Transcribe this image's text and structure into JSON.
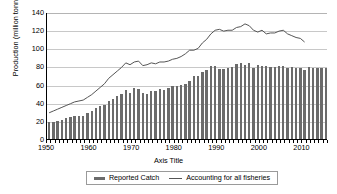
{
  "chart_data": {
    "type": "bar",
    "title": "",
    "xlabel": "Axis Title",
    "ylabel": "Production (million tonnes)",
    "ylim": [
      0,
      140
    ],
    "ytick_step": 20,
    "yticks": [
      0,
      20,
      40,
      60,
      80,
      100,
      120,
      140
    ],
    "xlim": [
      1950,
      2016
    ],
    "xticks": [
      1950,
      1960,
      1970,
      1980,
      1990,
      2000,
      2010
    ],
    "grid": true,
    "legend_position": "bottom",
    "x": [
      1950,
      1951,
      1952,
      1953,
      1954,
      1955,
      1956,
      1957,
      1958,
      1959,
      1960,
      1961,
      1962,
      1963,
      1964,
      1965,
      1966,
      1967,
      1968,
      1969,
      1970,
      1971,
      1972,
      1973,
      1974,
      1975,
      1976,
      1977,
      1978,
      1979,
      1980,
      1981,
      1982,
      1983,
      1984,
      1985,
      1986,
      1987,
      1988,
      1989,
      1990,
      1991,
      1992,
      1993,
      1994,
      1995,
      1996,
      1997,
      1998,
      1999,
      2000,
      2001,
      2002,
      2003,
      2004,
      2005,
      2006,
      2007,
      2008,
      2009,
      2010,
      2011,
      2012,
      2013,
      2014,
      2015
    ],
    "series": [
      {
        "name": "Reported Catch",
        "render": "bar",
        "color": "#6b6b6b",
        "values": [
          19,
          19,
          20,
          21,
          23,
          24,
          25,
          25,
          25,
          29,
          31,
          34,
          36,
          38,
          42,
          44,
          47,
          50,
          54,
          51,
          56,
          55,
          51,
          50,
          53,
          53,
          55,
          54,
          56,
          58,
          58,
          60,
          61,
          64,
          69,
          70,
          74,
          76,
          80,
          80,
          77,
          77,
          78,
          79,
          83,
          84,
          82,
          84,
          78,
          82,
          81,
          80,
          79,
          79,
          81,
          80,
          78,
          79,
          78,
          78,
          76,
          79,
          78,
          78,
          78,
          78
        ]
      },
      {
        "name": "Accounting for all fisheries",
        "render": "line",
        "color": "#555555",
        "values": [
          30,
          32,
          34,
          36,
          38,
          40,
          42,
          43,
          44,
          47,
          50,
          54,
          58,
          62,
          68,
          72,
          76,
          80,
          85,
          83,
          86,
          87,
          82,
          83,
          85,
          84,
          86,
          86,
          87,
          89,
          90,
          92,
          95,
          99,
          99,
          101,
          107,
          111,
          117,
          121,
          122,
          120,
          121,
          121,
          124,
          125,
          128,
          126,
          121,
          119,
          121,
          117,
          118,
          118,
          120,
          121,
          117,
          115,
          113,
          112,
          108,
          null,
          null,
          null,
          null,
          null
        ]
      }
    ]
  }
}
